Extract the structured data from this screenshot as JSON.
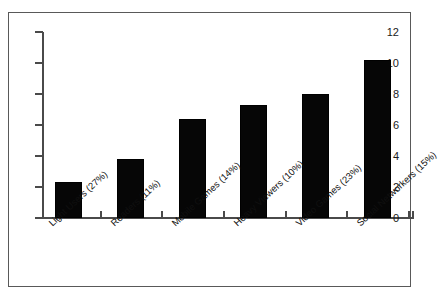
{
  "chart_data": {
    "type": "bar",
    "title": "",
    "subtitle": "",
    "xlabel": "",
    "ylabel": "",
    "categories": [
      "Light Users (27%)",
      "Readers (11%)",
      "Mobile Games (14%)",
      "Heavy Viewers (10%)",
      "Video Games (23%)",
      "Social Networkers (15%)"
    ],
    "values": [
      2.3,
      3.8,
      6.4,
      7.3,
      8.0,
      10.2
    ],
    "ylim": [
      0,
      12
    ],
    "ytick_labels": [
      "12",
      "10",
      "8",
      "6",
      "4",
      "2",
      "0"
    ],
    "ytick_values": [
      12,
      10,
      8,
      6,
      4,
      2,
      0
    ],
    "grid": false,
    "legend": false,
    "bar_color": "#060606",
    "axis_color": "#4a4a4a",
    "frame_color": "#595959",
    "background": "#ffffff"
  }
}
